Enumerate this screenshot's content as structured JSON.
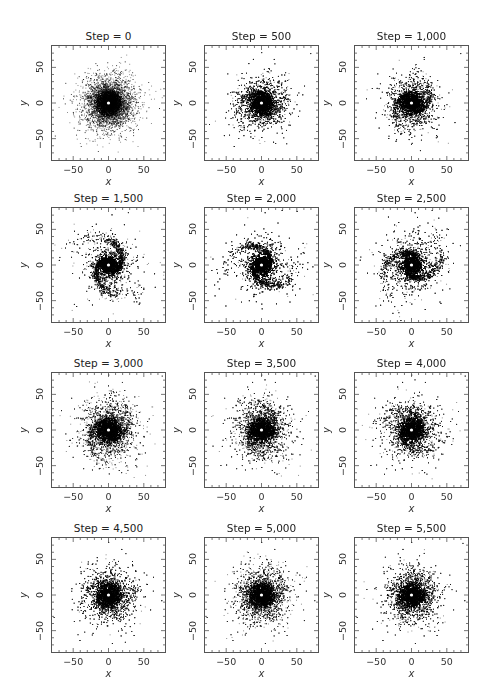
{
  "figure": {
    "grid": {
      "rows": 4,
      "cols": 3
    },
    "axis": {
      "range": [
        -80,
        80
      ],
      "major_ticks": [
        -50,
        0,
        50
      ],
      "major_tick_labels": [
        "−50",
        "0",
        "50"
      ],
      "minor_step": 10,
      "xlabel": "x",
      "ylabel": "y"
    },
    "colors": {
      "points": "#000000",
      "frame": "#555555",
      "center_marker": "#ffffff"
    }
  },
  "panels": [
    {
      "title": "Step = 0",
      "step": 0,
      "spiral": 0.0,
      "phase": 0.0,
      "spread": 22
    },
    {
      "title": "Step = 500",
      "step": 500,
      "spiral": 0.25,
      "phase": 0.6,
      "spread": 22
    },
    {
      "title": "Step = 1,000",
      "step": 1000,
      "spiral": 0.35,
      "phase": 1.2,
      "spread": 22
    },
    {
      "title": "Step = 1,500",
      "step": 1500,
      "spiral": 0.85,
      "phase": 1.8,
      "spread": 24
    },
    {
      "title": "Step = 2,000",
      "step": 2000,
      "spiral": 0.75,
      "phase": 2.6,
      "spread": 25
    },
    {
      "title": "Step = 2,500",
      "step": 2500,
      "spiral": 0.65,
      "phase": 3.4,
      "spread": 25
    },
    {
      "title": "Step = 3,000",
      "step": 3000,
      "spiral": 0.3,
      "phase": 4.2,
      "spread": 24
    },
    {
      "title": "Step = 3,500",
      "step": 3500,
      "spiral": 0.25,
      "phase": 4.9,
      "spread": 24
    },
    {
      "title": "Step = 4,000",
      "step": 4000,
      "spiral": 0.25,
      "phase": 5.6,
      "spread": 24
    },
    {
      "title": "Step = 4,500",
      "step": 4500,
      "spiral": 0.15,
      "phase": 0.3,
      "spread": 23
    },
    {
      "title": "Step = 5,000",
      "step": 5000,
      "spiral": 0.15,
      "phase": 1.0,
      "spread": 23
    },
    {
      "title": "Step = 5,500",
      "step": 5500,
      "spiral": 0.1,
      "phase": 1.7,
      "spread": 23
    }
  ],
  "chart_data": {
    "type": "scatter",
    "title": "",
    "xlabel": "x",
    "ylabel": "y",
    "xlim": [
      -80,
      80
    ],
    "ylim": [
      -80,
      80
    ],
    "x_ticks": [
      -50,
      0,
      50
    ],
    "y_ticks": [
      -50,
      0,
      50
    ],
    "grid": false,
    "legend": null,
    "layout": "4x3 small multiples",
    "panels": [
      {
        "title": "Step = 0",
        "description": "dense centrally concentrated disk, no spiral structure, white center marker at (0,0)"
      },
      {
        "title": "Step = 500",
        "description": "disk with faint ring/arm structure beginning"
      },
      {
        "title": "Step = 1,000",
        "description": "disk with faint arm structure"
      },
      {
        "title": "Step = 1,500",
        "description": "strong two-armed spiral pattern"
      },
      {
        "title": "Step = 2,000",
        "description": "two-armed spiral, slightly wound further"
      },
      {
        "title": "Step = 2,500",
        "description": "spiral arms becoming ring-like"
      },
      {
        "title": "Step = 3,000",
        "description": "diffuse disk, weak arms"
      },
      {
        "title": "Step = 3,500",
        "description": "diffuse disk, weak arms"
      },
      {
        "title": "Step = 4,000",
        "description": "diffuse disk"
      },
      {
        "title": "Step = 4,500",
        "description": "diffuse centrally concentrated disk"
      },
      {
        "title": "Step = 5,000",
        "description": "diffuse centrally concentrated disk"
      },
      {
        "title": "Step = 5,500",
        "description": "diffuse centrally concentrated disk"
      }
    ]
  }
}
